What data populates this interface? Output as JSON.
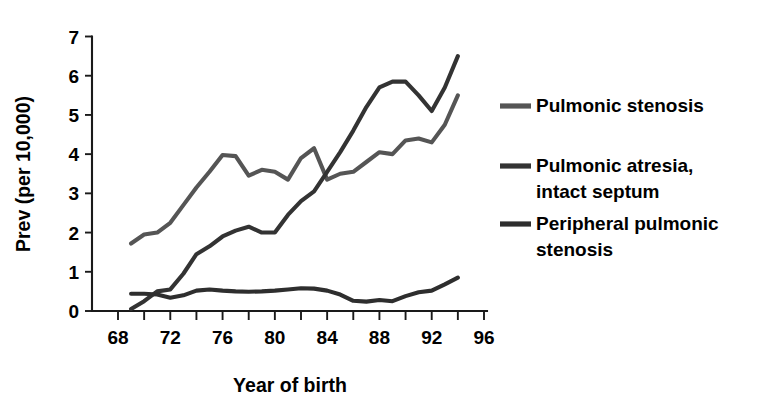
{
  "chart_data": {
    "type": "line",
    "title": "",
    "subtitle": "",
    "xlabel": "Year of birth",
    "ylabel": "Prev (per 10,000)",
    "xlim": [
      68,
      96
    ],
    "ylim": [
      0,
      7
    ],
    "x_tick_labels": [
      "68",
      "72",
      "76",
      "80",
      "84",
      "88",
      "92",
      "96"
    ],
    "x_tick_values": [
      68,
      72,
      76,
      80,
      84,
      88,
      92,
      96
    ],
    "x_minor_tick_values": [
      70,
      74,
      78,
      82,
      86,
      90,
      94
    ],
    "y_tick_labels": [
      "0",
      "1",
      "2",
      "3",
      "4",
      "5",
      "6",
      "7"
    ],
    "y_tick_values": [
      0,
      1,
      2,
      3,
      4,
      5,
      6,
      7
    ],
    "grid": false,
    "legend_position": "right",
    "x": [
      69,
      70,
      71,
      72,
      73,
      74,
      75,
      76,
      77,
      78,
      79,
      80,
      81,
      82,
      83,
      84,
      85,
      86,
      87,
      88,
      89,
      90,
      91,
      92,
      93,
      94
    ],
    "series": [
      {
        "name": "Pulmonic stenosis",
        "color": "#555555",
        "values": [
          1.72,
          1.95,
          2.0,
          2.25,
          2.7,
          3.15,
          3.55,
          3.98,
          3.95,
          3.45,
          3.6,
          3.55,
          3.35,
          3.9,
          4.15,
          3.35,
          3.5,
          3.55,
          3.8,
          4.05,
          4.0,
          4.35,
          4.4,
          4.3,
          4.75,
          5.5
        ]
      },
      {
        "name": "Pulmonic atresia, intact septum",
        "color": "#333333",
        "values": [
          0.05,
          0.25,
          0.5,
          0.55,
          0.95,
          1.45,
          1.65,
          1.9,
          2.05,
          2.15,
          2.0,
          2.0,
          2.45,
          2.8,
          3.05,
          3.55,
          4.05,
          4.6,
          5.2,
          5.7,
          5.85,
          5.85,
          5.5,
          5.1,
          5.7,
          6.5
        ]
      },
      {
        "name": "Peripheral pulmonic stenosis",
        "color": "#2e2e2e",
        "values": [
          0.44,
          0.44,
          0.42,
          0.34,
          0.4,
          0.52,
          0.55,
          0.52,
          0.5,
          0.49,
          0.5,
          0.52,
          0.55,
          0.58,
          0.57,
          0.52,
          0.42,
          0.26,
          0.24,
          0.28,
          0.25,
          0.38,
          0.48,
          0.52,
          0.68,
          0.85
        ]
      }
    ]
  },
  "axis": {
    "y_label": "Prev (per 10,000)",
    "x_label": "Year of birth"
  },
  "legend": {
    "items": [
      {
        "label": "Pulmonic stenosis",
        "label_line2": "",
        "color": "#555555"
      },
      {
        "label": "Pulmonic atresia,",
        "label_line2": "intact septum",
        "color": "#333333"
      },
      {
        "label": "Peripheral pulmonic",
        "label_line2": "stenosis",
        "color": "#2e2e2e"
      }
    ]
  }
}
